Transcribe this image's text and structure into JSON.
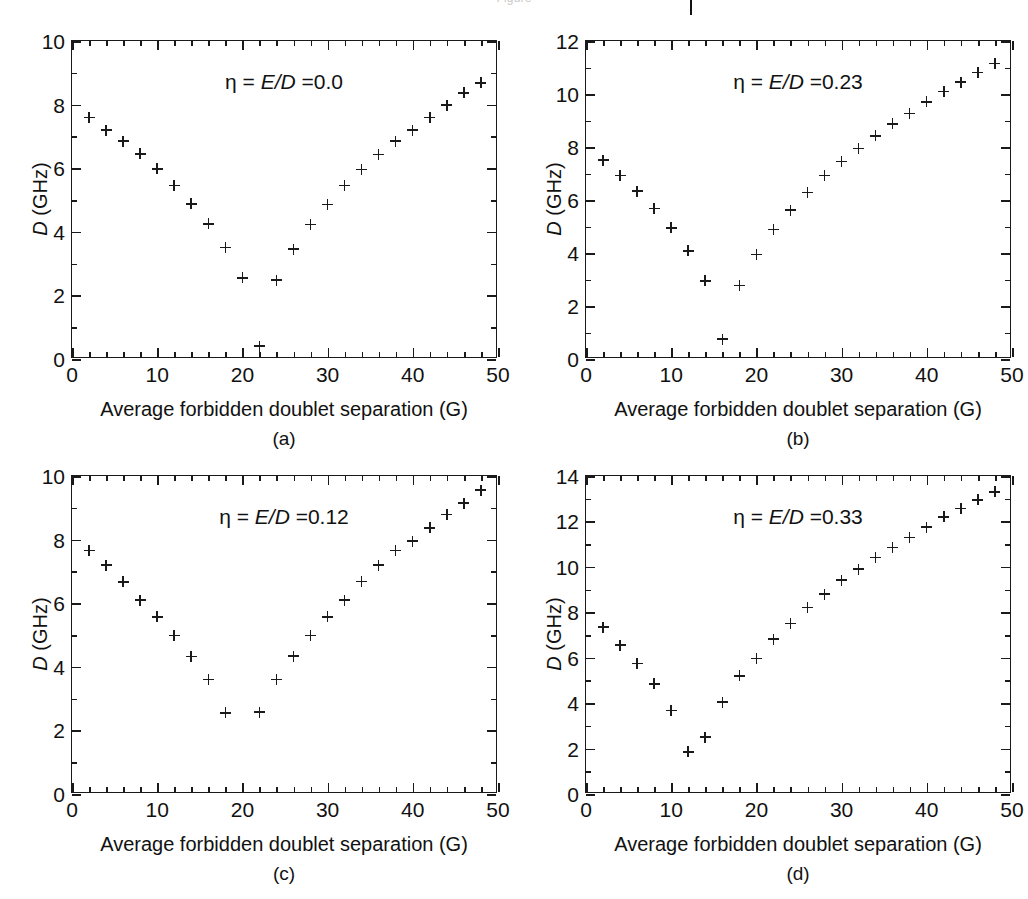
{
  "figure": {
    "cropped_header_text": "Figure",
    "background": "#ffffff",
    "marker_color": "#1a1a1a",
    "axis_color": "#1a1a1a"
  },
  "common": {
    "xlabel": "Average forbidden doublet separation (G)",
    "ylabel_prefix": "D",
    "ylabel_suffix": " (GHz)",
    "eta_prefix": "η = ",
    "eta_ratio": "E/D",
    "eta_equals": " ="
  },
  "chart_data": [
    {
      "type": "scatter",
      "panel": "(a)",
      "title": "η = E/D =0.0",
      "eta_value": "0.0",
      "xlabel": "Average forbidden doublet separation (G)",
      "ylabel": "D (GHz)",
      "xlim": [
        0,
        50
      ],
      "ylim": [
        0,
        10
      ],
      "xticks": [
        0,
        10,
        20,
        30,
        40,
        50
      ],
      "xticks_minor_step": 2,
      "yticks": [
        0,
        2,
        4,
        6,
        8,
        10
      ],
      "yticks_minor_step": 1,
      "grid": false,
      "legend": "none",
      "marker": "plus",
      "x": [
        2,
        4,
        6,
        8,
        10,
        12,
        14,
        16,
        18,
        20,
        22,
        24,
        26,
        28,
        30,
        32,
        34,
        36,
        38,
        40,
        42,
        44,
        46,
        48
      ],
      "y": [
        7.6,
        7.2,
        6.85,
        6.45,
        5.98,
        5.45,
        4.88,
        4.25,
        3.5,
        2.55,
        0.4,
        2.48,
        3.45,
        4.22,
        4.85,
        5.45,
        5.95,
        6.43,
        6.85,
        7.2,
        7.6,
        7.98,
        8.37,
        8.68
      ]
    },
    {
      "type": "scatter",
      "panel": "(b)",
      "title": "η = E/D =0.23",
      "eta_value": "0.23",
      "xlabel": "Average forbidden doublet separation (G)",
      "ylabel": "D (GHz)",
      "xlim": [
        0,
        50
      ],
      "ylim": [
        0,
        12
      ],
      "xticks": [
        0,
        10,
        20,
        30,
        40,
        50
      ],
      "xticks_minor_step": 2,
      "yticks": [
        0,
        2,
        4,
        6,
        8,
        10,
        12
      ],
      "yticks_minor_step": 1,
      "grid": false,
      "legend": "none",
      "marker": "plus",
      "x": [
        2,
        4,
        6,
        8,
        10,
        12,
        14,
        16,
        18,
        20,
        22,
        24,
        26,
        28,
        30,
        32,
        34,
        36,
        38,
        40,
        42,
        44,
        46,
        48
      ],
      "y": [
        7.5,
        6.92,
        6.33,
        5.67,
        4.95,
        4.08,
        2.95,
        0.75,
        2.78,
        3.95,
        4.88,
        5.62,
        6.28,
        6.92,
        7.45,
        7.95,
        8.42,
        8.87,
        9.27,
        9.7,
        10.1,
        10.45,
        10.8,
        11.15
      ]
    },
    {
      "type": "scatter",
      "panel": "(c)",
      "title": "η = E/D =0.12",
      "eta_value": "0.12",
      "xlabel": "Average forbidden doublet separation (G)",
      "ylabel": "D (GHz)",
      "xlim": [
        0,
        50
      ],
      "ylim": [
        0,
        10
      ],
      "xticks": [
        0,
        10,
        20,
        30,
        40,
        50
      ],
      "xticks_minor_step": 2,
      "yticks": [
        0,
        2,
        4,
        6,
        8,
        10
      ],
      "yticks_minor_step": 1,
      "grid": false,
      "legend": "none",
      "marker": "plus",
      "x": [
        2,
        4,
        6,
        8,
        10,
        12,
        14,
        16,
        18,
        22,
        24,
        26,
        28,
        30,
        32,
        34,
        36,
        38,
        40,
        42,
        44,
        46,
        48
      ],
      "y": [
        7.65,
        7.2,
        6.67,
        6.1,
        5.57,
        4.98,
        4.32,
        3.6,
        2.55,
        2.57,
        3.6,
        4.33,
        4.98,
        5.57,
        6.1,
        6.68,
        7.2,
        7.65,
        7.95,
        8.37,
        8.78,
        9.15,
        9.55
      ]
    },
    {
      "type": "scatter",
      "panel": "(d)",
      "title": "η = E/D =0.33",
      "eta_value": "0.33",
      "xlabel": "Average forbidden doublet separation (G)",
      "ylabel": "D (GHz)",
      "xlim": [
        0,
        50
      ],
      "ylim": [
        0,
        14
      ],
      "xticks": [
        0,
        10,
        20,
        30,
        40,
        50
      ],
      "xticks_minor_step": 2,
      "yticks": [
        0,
        2,
        4,
        6,
        8,
        10,
        12,
        14
      ],
      "yticks_minor_step": 1,
      "grid": false,
      "legend": "none",
      "marker": "plus",
      "x": [
        2,
        4,
        6,
        8,
        10,
        12,
        14,
        16,
        18,
        20,
        22,
        24,
        26,
        28,
        30,
        32,
        34,
        36,
        38,
        40,
        42,
        44,
        46,
        48
      ],
      "y": [
        7.35,
        6.55,
        5.75,
        4.85,
        3.67,
        1.85,
        2.5,
        4.05,
        5.2,
        5.97,
        6.82,
        7.5,
        8.2,
        8.8,
        9.42,
        9.9,
        10.4,
        10.85,
        11.3,
        11.75,
        12.2,
        12.57,
        12.95,
        13.3
      ]
    }
  ],
  "panel_labels": [
    "(a)",
    "(b)",
    "(c)",
    "(d)"
  ]
}
